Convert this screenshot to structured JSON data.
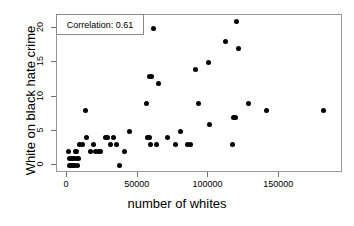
{
  "chart_data": {
    "type": "scatter",
    "title": "",
    "xlabel": "number of whites",
    "ylabel": "White on black hate crime",
    "xlim": [
      -7000,
      195000
    ],
    "ylim": [
      -1.1,
      21.9
    ],
    "xticks": [
      0,
      50000,
      100000,
      150000
    ],
    "xticklabels": [
      "0",
      "50000",
      "100000",
      "150000"
    ],
    "yticks": [
      0,
      5,
      10,
      15,
      20
    ],
    "yticklabels": [
      "0",
      "5",
      "10",
      "15",
      "20"
    ],
    "grid": false,
    "legend_position": "top-left",
    "annotations": [
      {
        "name": "correlation-box",
        "text": "Correlation: 0.61",
        "value": 0.61
      }
    ],
    "marker": {
      "shape": "circle",
      "filled": true,
      "color": "#000000",
      "size": 5
    },
    "series": [
      {
        "name": "counties",
        "color": "#000000",
        "points": [
          [
            1000,
            2
          ],
          [
            1500,
            1
          ],
          [
            2000,
            0
          ],
          [
            2500,
            0
          ],
          [
            3000,
            1
          ],
          [
            3500,
            0
          ],
          [
            4000,
            1
          ],
          [
            4500,
            0
          ],
          [
            5000,
            1
          ],
          [
            5500,
            0
          ],
          [
            6000,
            2
          ],
          [
            6500,
            1
          ],
          [
            7000,
            2
          ],
          [
            7500,
            0
          ],
          [
            8000,
            1
          ],
          [
            9000,
            3
          ],
          [
            11000,
            3
          ],
          [
            13000,
            8
          ],
          [
            14000,
            4
          ],
          [
            17000,
            2
          ],
          [
            19000,
            3
          ],
          [
            20000,
            2
          ],
          [
            22000,
            2
          ],
          [
            24000,
            2
          ],
          [
            27000,
            4
          ],
          [
            29000,
            4
          ],
          [
            31000,
            3
          ],
          [
            33000,
            4
          ],
          [
            35000,
            3
          ],
          [
            37000,
            0
          ],
          [
            41000,
            2
          ],
          [
            44000,
            5
          ],
          [
            56000,
            9
          ],
          [
            57000,
            4
          ],
          [
            58000,
            13
          ],
          [
            58500,
            4
          ],
          [
            59000,
            3
          ],
          [
            60000,
            13
          ],
          [
            61000,
            20
          ],
          [
            63000,
            3
          ],
          [
            65000,
            12
          ],
          [
            71000,
            4
          ],
          [
            77000,
            3
          ],
          [
            80000,
            5
          ],
          [
            85000,
            3
          ],
          [
            87000,
            3
          ],
          [
            91000,
            14
          ],
          [
            93000,
            9
          ],
          [
            100000,
            15
          ],
          [
            101000,
            6
          ],
          [
            112000,
            18
          ],
          [
            117000,
            3
          ],
          [
            118000,
            7
          ],
          [
            119000,
            7
          ],
          [
            120000,
            21
          ],
          [
            121000,
            17
          ],
          [
            128000,
            9
          ],
          [
            141000,
            8
          ],
          [
            181000,
            8
          ]
        ]
      }
    ]
  }
}
